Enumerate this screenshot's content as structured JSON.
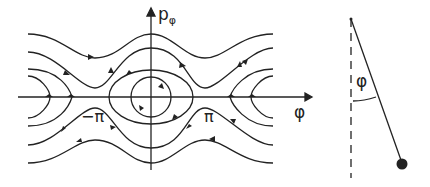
{
  "phase_portrait": {
    "y_axis_label": "p",
    "y_axis_subscript": "φ",
    "x_axis_label": "φ",
    "tick_neg_pi": "−π",
    "tick_pi": "π"
  },
  "pendulum": {
    "angle_label": "φ"
  },
  "colors": {
    "ink": "#222222",
    "background": "#ffffff"
  }
}
